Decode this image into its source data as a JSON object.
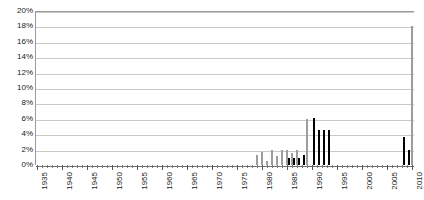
{
  "chart_data": {
    "type": "bar",
    "title": "",
    "subtitle": "",
    "xlabel": "",
    "ylabel": "",
    "xlim": [
      1935,
      2010
    ],
    "ylim": [
      0,
      20
    ],
    "y_tick_step": 2,
    "y_tick_suffix": "%",
    "grid": true,
    "legend": "none",
    "x_tick_interval": 1,
    "x_label_interval": 5,
    "y_ticks": [
      "20%",
      "18%",
      "16%",
      "14%",
      "12%",
      "10%",
      "8%",
      "6%",
      "4%",
      "2%",
      "0%"
    ],
    "y_tick_values": [
      20,
      18,
      16,
      14,
      12,
      10,
      8,
      6,
      4,
      2,
      0
    ],
    "x_tick_labels": [
      "1935",
      "1940",
      "1945",
      "1950",
      "1955",
      "1960",
      "1965",
      "1970",
      "1975",
      "1980",
      "1985",
      "1990",
      "1995",
      "2000",
      "2005",
      "2010"
    ],
    "x_label_values": [
      1935,
      1940,
      1945,
      1950,
      1955,
      1960,
      1965,
      1970,
      1975,
      1980,
      1985,
      1990,
      1995,
      2000,
      2005,
      2010
    ],
    "categories": [
      1935,
      1936,
      1937,
      1938,
      1939,
      1940,
      1941,
      1942,
      1943,
      1944,
      1945,
      1946,
      1947,
      1948,
      1949,
      1950,
      1951,
      1952,
      1953,
      1954,
      1955,
      1956,
      1957,
      1958,
      1959,
      1960,
      1961,
      1962,
      1963,
      1964,
      1965,
      1966,
      1967,
      1968,
      1969,
      1970,
      1971,
      1972,
      1973,
      1974,
      1975,
      1976,
      1977,
      1978,
      1979,
      1980,
      1981,
      1982,
      1983,
      1984,
      1985,
      1986,
      1987,
      1988,
      1989,
      1990,
      1991,
      1992,
      1993,
      1994,
      1995,
      1996,
      1997,
      1998,
      1999,
      2000,
      2001,
      2002,
      2003,
      2004,
      2005,
      2006,
      2007,
      2008,
      2009,
      2010
    ],
    "series": [
      {
        "name": "series-light",
        "color": "#c6c6c6",
        "values": [
          0,
          0,
          0,
          0,
          0,
          0,
          0,
          0,
          0,
          0,
          0,
          0,
          0,
          0,
          0,
          0,
          0,
          0,
          0,
          0,
          0,
          0,
          0,
          0,
          0,
          0,
          0,
          0,
          0,
          0,
          0,
          0,
          0,
          0,
          0,
          0,
          0,
          0,
          0,
          0,
          0,
          0,
          0,
          0,
          1.3,
          1.7,
          0.5,
          1.9,
          1.2,
          1.9,
          2.0,
          1.5,
          1.9,
          0,
          6.0,
          0,
          0,
          0,
          0,
          0,
          0,
          0,
          0,
          0,
          0,
          0,
          0,
          0,
          0,
          0,
          0,
          0,
          0,
          0,
          0,
          18.0
        ]
      },
      {
        "name": "series-dark",
        "color": "#1b1b1b",
        "values": [
          0,
          0,
          0,
          0,
          0,
          0,
          0,
          0,
          0,
          0,
          0,
          0,
          0,
          0,
          0,
          0,
          0,
          0,
          0,
          0,
          0,
          0,
          0,
          0,
          0,
          0,
          0,
          0,
          0,
          0,
          0,
          0,
          0,
          0,
          0,
          0,
          0,
          0,
          0,
          0,
          0,
          0,
          0,
          0,
          0,
          0,
          0,
          0,
          0,
          0,
          0.9,
          0.9,
          0.9,
          1.3,
          0,
          6.1,
          4.6,
          4.6,
          4.6,
          0,
          0,
          0,
          0,
          0,
          0,
          0,
          0,
          0,
          0,
          0,
          0,
          0,
          0,
          3.6,
          2.0,
          0
        ]
      }
    ]
  }
}
